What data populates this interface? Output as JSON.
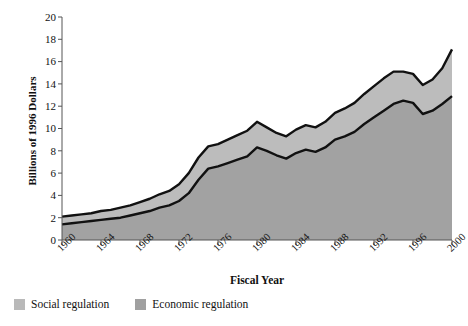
{
  "chart_data": {
    "type": "area",
    "title": "",
    "subtitle": "",
    "xlabel": "Fiscal Year",
    "ylabel": "Billions of 1996 Dollars",
    "stacked": true,
    "grid": false,
    "legend_position": "bottom-left",
    "xlim": [
      1960,
      2000
    ],
    "ylim": [
      0,
      20
    ],
    "xticks": [
      1960,
      1964,
      1968,
      1972,
      1976,
      1980,
      1984,
      1988,
      1992,
      1996,
      2000
    ],
    "yticks": [
      0,
      2,
      4,
      6,
      8,
      10,
      12,
      14,
      16,
      18,
      20
    ],
    "xtick_labels": [
      "1960",
      "1964",
      "1968",
      "1972",
      "1976",
      "1980",
      "1984",
      "1988",
      "1992",
      "1996",
      "2000"
    ],
    "ytick_labels": [
      "0",
      "2",
      "4",
      "6",
      "8",
      "10",
      "12",
      "14",
      "16",
      "18",
      "20"
    ],
    "x": [
      1960,
      1961,
      1962,
      1963,
      1964,
      1965,
      1966,
      1967,
      1968,
      1969,
      1970,
      1971,
      1972,
      1973,
      1974,
      1975,
      1976,
      1977,
      1978,
      1979,
      1980,
      1981,
      1982,
      1983,
      1984,
      1985,
      1986,
      1987,
      1988,
      1989,
      1990,
      1991,
      1992,
      1993,
      1994,
      1995,
      1996,
      1997,
      1998,
      1999,
      2000
    ],
    "series": [
      {
        "name": "Economic regulation",
        "color": "#a2a2a2",
        "values": [
          1.4,
          1.5,
          1.6,
          1.7,
          1.8,
          1.9,
          2.0,
          2.2,
          2.4,
          2.6,
          2.9,
          3.1,
          3.5,
          4.2,
          5.4,
          6.4,
          6.6,
          6.9,
          7.2,
          7.5,
          8.3,
          8.0,
          7.6,
          7.3,
          7.8,
          8.1,
          7.9,
          8.3,
          9.0,
          9.3,
          9.7,
          10.4,
          11.0,
          11.6,
          12.2,
          12.5,
          12.3,
          11.3,
          11.6,
          12.2,
          12.9
        ]
      },
      {
        "name": "Social regulation",
        "color": "#bcbcbc",
        "values": [
          0.7,
          0.7,
          0.7,
          0.7,
          0.8,
          0.8,
          0.9,
          0.9,
          1.0,
          1.1,
          1.2,
          1.3,
          1.5,
          1.8,
          2.0,
          2.0,
          2.0,
          2.1,
          2.2,
          2.3,
          2.3,
          2.1,
          2.0,
          2.0,
          2.1,
          2.2,
          2.2,
          2.3,
          2.4,
          2.5,
          2.6,
          2.7,
          2.8,
          2.9,
          2.9,
          2.6,
          2.6,
          2.6,
          2.8,
          3.2,
          4.2
        ]
      }
    ],
    "totals": [
      2.1,
      2.2,
      2.3,
      2.4,
      2.6,
      2.7,
      2.9,
      3.1,
      3.4,
      3.7,
      4.1,
      4.4,
      5.0,
      6.0,
      7.4,
      8.4,
      8.6,
      9.0,
      9.4,
      9.8,
      10.6,
      10.1,
      9.6,
      9.3,
      9.9,
      10.3,
      10.1,
      10.6,
      11.4,
      11.8,
      12.3,
      13.1,
      13.8,
      14.5,
      15.1,
      15.1,
      14.9,
      13.9,
      14.4,
      15.4,
      17.1
    ]
  },
  "legend": {
    "items": [
      {
        "label": "Social regulation",
        "swatch": "light-gray-swatch"
      },
      {
        "label": "Economic regulation",
        "swatch": "dark-gray-swatch"
      }
    ]
  },
  "colors": {
    "social_fill": "#bcbcbc",
    "economic_fill": "#a2a2a2",
    "line": "#111111",
    "axis": "#555555",
    "text": "#111111",
    "background": "#ffffff"
  }
}
